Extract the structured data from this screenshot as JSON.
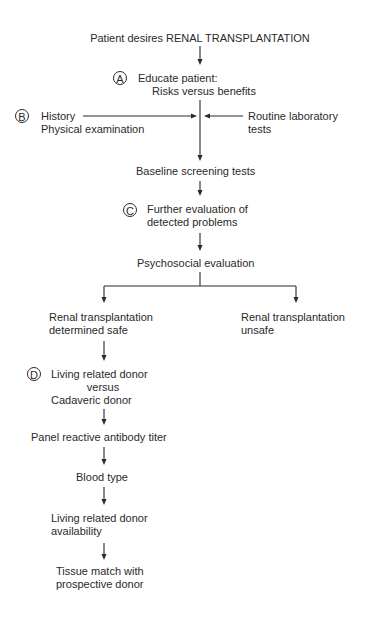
{
  "diagram": {
    "title": "Patient desires RENAL TRANSPLANTATION",
    "steps": {
      "educate": {
        "badge": "A",
        "line1": "Educate patient:",
        "line2": "Risks versus benefits"
      },
      "history": {
        "badge": "B",
        "line1": "History",
        "line2": "Physical examination"
      },
      "routine_lab": {
        "line1": "Routine laboratory",
        "line2": "tests"
      },
      "baseline": {
        "line1": "Baseline screening tests"
      },
      "further_eval": {
        "badge": "C",
        "line1": "Further evaluation of",
        "line2": "detected problems"
      },
      "psychosocial": {
        "line1": "Psychosocial evaluation"
      },
      "safe": {
        "line1": "Renal transplantation",
        "line2": "determined safe"
      },
      "unsafe": {
        "line1": "Renal transplantation",
        "line2": "unsafe"
      },
      "donor_type": {
        "badge": "D",
        "line1": "Living related donor",
        "line2": "versus",
        "line3": "Cadaveric donor"
      },
      "pra": {
        "line1": "Panel reactive antibody titer"
      },
      "blood_type": {
        "line1": "Blood type"
      },
      "lrd_availability": {
        "line1": "Living related donor",
        "line2": "availability"
      },
      "tissue_match": {
        "line1": "Tissue match with",
        "line2": "prospective donor"
      }
    }
  }
}
